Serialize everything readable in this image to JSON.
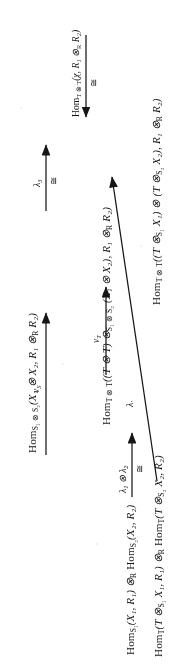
{
  "document": {
    "type": "commutative-diagram",
    "orientation": "rotated-90-ccw",
    "page_background": "#ffffff",
    "ink_color": "#1a1a1a"
  },
  "nodes": {
    "bottom_left": "Homₛ₁(X₁, R₁) ⊗_R Homₛ₂(X₂, R₂)",
    "top_left": "Homₛ₁⊗ₛ₂(X₁ ⊗ X₂, R₁ ⊗_R R₂)",
    "bottom_middle": "Hom_T(T ⊗ₛ₁ X₁, R₁) ⊗_R Hom_T(T ⊗ₛ₂ X₂, R₂)",
    "top_middle": "Hom_{T⊗T}((T ⊗ T) ⊗ₛ₁⊗ₛ₂ (X₁ ⊗ X₂), R₁ ⊗_R R₂)",
    "right": "Hom_{T⊗T}((T ⊗ₛ₁ X₁) ⊗ (T ⊗ₛ₂ X₂), R₁ ⊗_R R₂)"
  },
  "node_parts": {
    "bottom_left": {
      "a": "Hom",
      "a_sub": "S₁",
      "b": "(X₁, R₁) ⊗",
      "b_sub": "R",
      "c": "Hom",
      "c_sub": "S₂",
      "d": "(X₂, R₂)"
    },
    "top_left": {
      "a": "Hom",
      "a_sub": "S₁ ⊗ S₂",
      "b": "(X₁ ⊗ X₂, R₁ ⊗",
      "b_sub": "R",
      "c": " R₂)"
    },
    "bottom_middle": {
      "a": "Hom",
      "a_sub": "T",
      "b": "(T ⊗",
      "b_sub": "S₁",
      "c": " X₁, R₁) ⊗",
      "c_sub": "R",
      "d": "Hom",
      "d_sub": "T",
      "e": "(T ⊗",
      "e_sub": "S₂",
      "f": " X₂, R₂)"
    },
    "top_middle": {
      "a": "Hom",
      "a_sub": "T ⊗ T",
      "b": "((T ⊗ T) ⊗",
      "b_sub": "S₁ ⊗ S₂",
      "c": " (X₁ ⊗ X₂), R₁ ⊗",
      "c_sub": "R",
      "d": " R₂)"
    },
    "right": {
      "a": "Hom",
      "a_sub": "T ⊗ T",
      "b": "((T ⊗",
      "b_sub": "S₁",
      "c": " X₁) ⊗ (T ⊗",
      "c_sub": "S₂",
      "d": " X₂), R₁ ⊗",
      "d_sub": "R",
      "e": " R₂)"
    }
  },
  "arrows": [
    {
      "id": "left-vertical",
      "from": "bottom_left",
      "to": "top_left",
      "label": "νₛ",
      "label_parts": {
        "main": "ν",
        "sub": "S"
      },
      "iso": ""
    },
    {
      "id": "middle-vertical",
      "from": "bottom_middle",
      "to": "top_middle",
      "label": "ν_T",
      "label_parts": {
        "main": "ν",
        "sub": "T"
      },
      "iso": ""
    },
    {
      "id": "bottom-horizontal",
      "from": "bottom_left",
      "to": "bottom_middle",
      "label": "λ₁ ⊗ λ₂",
      "label_parts": {
        "main": "λ",
        "sub": "1",
        "main2": " ⊗ λ",
        "sub2": "2"
      },
      "iso": "≅"
    },
    {
      "id": "top-horizontal",
      "from": "top_left",
      "to": "top_middle",
      "label": "λ₃",
      "label_parts": {
        "main": "λ",
        "sub": "3"
      },
      "iso": "≅"
    },
    {
      "id": "right-horizontal",
      "from": "right",
      "to": "top_middle",
      "label": "Hom_{T⊗T}(χ, R₁ ⊗_R R₂)",
      "label_parts": {
        "a": "Hom",
        "a_sub": "T ⊗ T",
        "b": "(χ, R₁ ⊗",
        "b_sub": "R",
        "c": " R₂)"
      },
      "iso": "≅"
    },
    {
      "id": "diagonal",
      "from": "bottom_middle",
      "to": "right",
      "label": "λ'",
      "label_parts": {
        "main": "λ",
        "sub": "′"
      },
      "iso": ""
    }
  ],
  "symbols": {
    "tensor": "⊗",
    "iso": "≅",
    "lambda": "λ",
    "nu": "ν",
    "chi": "χ"
  }
}
